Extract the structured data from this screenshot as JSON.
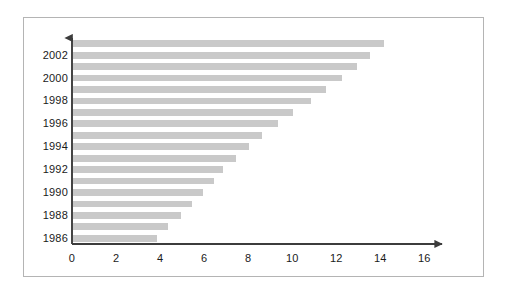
{
  "chart_data": {
    "type": "bar",
    "orientation": "horizontal",
    "title": "",
    "subtitle": "",
    "xlabel": "",
    "ylabel": "",
    "xlim": [
      0,
      16.8
    ],
    "ylim": [
      1985.4,
      2003.6
    ],
    "grid": false,
    "legend": null,
    "legend_position": "none",
    "bar_color": "#c9c9c9",
    "axis_color": "#3c3c3c",
    "frame_color": "#b4b4b4",
    "background_color": "#ffffff",
    "xticks": [
      0,
      2,
      4,
      6,
      8,
      10,
      12,
      14,
      16
    ],
    "xtick_labels": [
      "0",
      "2",
      "4",
      "6",
      "8",
      "10",
      "12",
      "14",
      "16"
    ],
    "yticks": [
      2002,
      2000,
      1998,
      1996,
      1994,
      1992,
      1990,
      1988,
      1986
    ],
    "ytick_labels": [
      "2002",
      "2000",
      "1998",
      "1996",
      "1994",
      "1992",
      "1990",
      "1988",
      "1986"
    ],
    "categories": [
      "2003",
      "2002",
      "2001",
      "2000",
      "1999",
      "1998",
      "1997",
      "1996",
      "1995",
      "1994",
      "1993",
      "1992",
      "1991",
      "1990",
      "1989",
      "1988",
      "1987",
      "1986"
    ],
    "values": [
      14.1,
      13.5,
      12.9,
      12.2,
      11.5,
      10.8,
      10.0,
      9.3,
      8.6,
      8.0,
      7.4,
      6.8,
      6.4,
      5.9,
      5.4,
      4.9,
      4.3,
      3.8
    ],
    "annotations": []
  }
}
